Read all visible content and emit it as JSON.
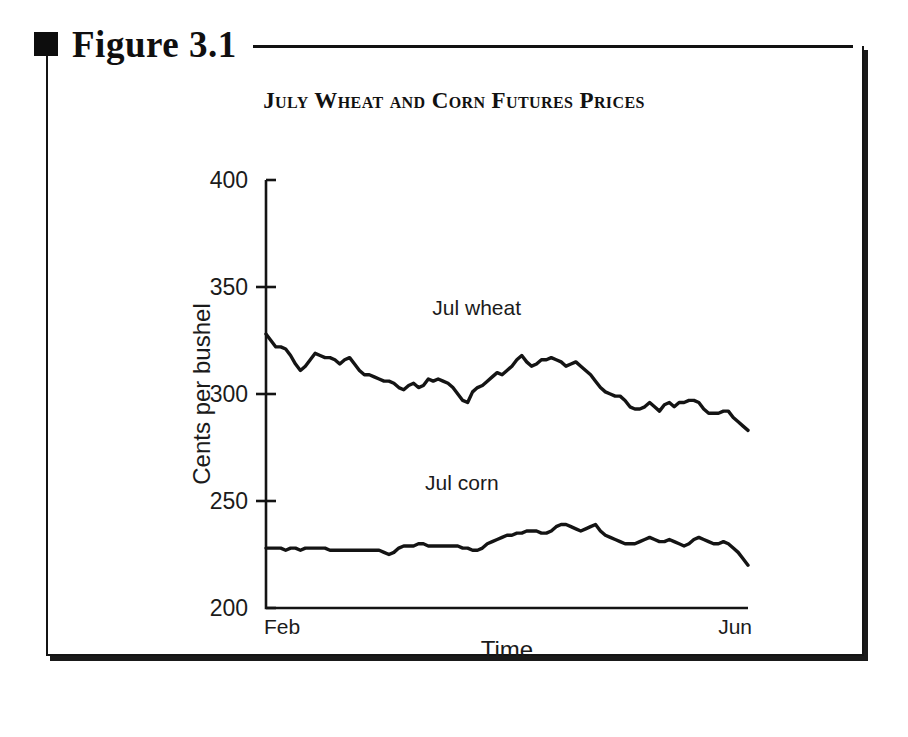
{
  "figure": {
    "bullet_icon": "square-bullet-icon",
    "label": "Figure 3.1"
  },
  "chart_data": {
    "type": "line",
    "title": "July Wheat and Corn Futures Prices",
    "xlabel": "Time",
    "ylabel": "Cents per bushel",
    "ylim": [
      200,
      400
    ],
    "yticks": [
      200,
      250,
      300,
      350,
      400
    ],
    "ytick_labels": [
      "200",
      "250",
      "300",
      "350",
      "400"
    ],
    "xlim_labels": [
      "Feb",
      "Jun"
    ],
    "x_start_label": "Feb",
    "x_end_label": "Jun",
    "grid": false,
    "legend_position": "inline-annotation",
    "annotations": [
      {
        "text": "Jul wheat",
        "x_frac": 0.345,
        "value": 337
      },
      {
        "text": "Jul corn",
        "x_frac": 0.33,
        "value": 255
      }
    ],
    "series": [
      {
        "name": "Jul wheat",
        "line_color": "#141414",
        "values": [
          328,
          325,
          322,
          322,
          321,
          318,
          314,
          311,
          313,
          316,
          319,
          318,
          317,
          317,
          316,
          314,
          316,
          317,
          314,
          311,
          309,
          309,
          308,
          307,
          306,
          306,
          305,
          303,
          302,
          304,
          305,
          303,
          304,
          307,
          306,
          307,
          306,
          305,
          303,
          300,
          297,
          296,
          301,
          303,
          304,
          306,
          308,
          310,
          309,
          311,
          313,
          316,
          318,
          315,
          313,
          314,
          316,
          316,
          317,
          316,
          315,
          313,
          314,
          315,
          313,
          311,
          309,
          306,
          303,
          301,
          300,
          299,
          299,
          297,
          294,
          293,
          293,
          294,
          296,
          294,
          292,
          295,
          296,
          294,
          296,
          296,
          297,
          297,
          296,
          293,
          291,
          291,
          291,
          292,
          292,
          289,
          287,
          285,
          283
        ]
      },
      {
        "name": "Jul corn",
        "line_color": "#141414",
        "values": [
          228,
          228,
          228,
          228,
          227,
          228,
          228,
          227,
          228,
          228,
          228,
          228,
          228,
          227,
          227,
          227,
          227,
          227,
          227,
          227,
          227,
          227,
          227,
          227,
          226,
          225,
          226,
          228,
          229,
          229,
          229,
          230,
          230,
          229,
          229,
          229,
          229,
          229,
          229,
          229,
          228,
          228,
          227,
          227,
          228,
          230,
          231,
          232,
          233,
          234,
          234,
          235,
          235,
          236,
          236,
          236,
          235,
          235,
          236,
          238,
          239,
          239,
          238,
          237,
          236,
          237,
          238,
          239,
          236,
          234,
          233,
          232,
          231,
          230,
          230,
          230,
          231,
          232,
          233,
          232,
          231,
          231,
          232,
          231,
          230,
          229,
          230,
          232,
          233,
          232,
          231,
          230,
          230,
          231,
          230,
          228,
          226,
          223,
          220
        ]
      }
    ]
  }
}
